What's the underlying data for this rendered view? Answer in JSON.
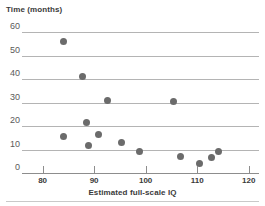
{
  "chart": {
    "y_axis_title": "Time (months)",
    "x_axis_title": "Estimated full-scale IQ"
  },
  "chart_data": {
    "type": "scatter",
    "title": "",
    "ylabel": "Time (months)",
    "xlabel": "Estimated full-scale IQ",
    "xlim": [
      76,
      122
    ],
    "ylim": [
      0,
      60
    ],
    "xticks": [
      80,
      90,
      100,
      110,
      120
    ],
    "yticks": [
      0,
      10,
      20,
      30,
      40,
      50,
      60
    ],
    "grid": "horizontal",
    "legend": "none",
    "marker_color": "#6b6b6b",
    "points": [
      {
        "x": 84.0,
        "y": 56.0
      },
      {
        "x": 87.8,
        "y": 41.0
      },
      {
        "x": 92.5,
        "y": 31.0
      },
      {
        "x": 105.5,
        "y": 30.5
      },
      {
        "x": 88.6,
        "y": 21.5
      },
      {
        "x": 90.8,
        "y": 16.5
      },
      {
        "x": 84.0,
        "y": 15.5
      },
      {
        "x": 95.3,
        "y": 13.0
      },
      {
        "x": 89.0,
        "y": 11.5
      },
      {
        "x": 98.8,
        "y": 9.0
      },
      {
        "x": 114.2,
        "y": 9.0
      },
      {
        "x": 106.8,
        "y": 7.0
      },
      {
        "x": 112.7,
        "y": 6.5
      },
      {
        "x": 110.5,
        "y": 4.0
      }
    ]
  }
}
